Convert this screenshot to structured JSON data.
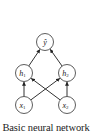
{
  "caption": "Basic neural network",
  "diagram": {
    "nodes": [
      {
        "id": "y_hat",
        "label": "ŷ",
        "sub": "",
        "x": 45,
        "y": 42
      },
      {
        "id": "h1",
        "label": "h",
        "sub": "1",
        "x": 24,
        "y": 73
      },
      {
        "id": "h2",
        "label": "h",
        "sub": "2",
        "x": 67,
        "y": 73
      },
      {
        "id": "x1",
        "label": "x",
        "sub": "1",
        "x": 24,
        "y": 105
      },
      {
        "id": "x2",
        "label": "x",
        "sub": "2",
        "x": 67,
        "y": 105
      }
    ],
    "edges": [
      {
        "from": "x1",
        "to": "h1"
      },
      {
        "from": "x1",
        "to": "h2"
      },
      {
        "from": "x2",
        "to": "h1"
      },
      {
        "from": "x2",
        "to": "h2"
      },
      {
        "from": "h1",
        "to": "y_hat"
      },
      {
        "from": "h2",
        "to": "y_hat"
      }
    ],
    "colors": {
      "stroke": "#333333",
      "fill": "#ffffff"
    }
  }
}
